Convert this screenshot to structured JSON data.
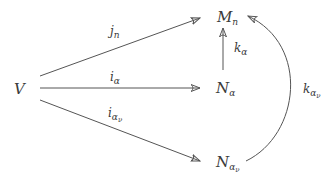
{
  "diagram": {
    "type": "commutative-diagram",
    "colors": {
      "stroke": "#555555",
      "text": "#3a3a3a",
      "background": "#ffffff"
    },
    "nodes": {
      "V": {
        "base": "V",
        "sub": "",
        "subsub": ""
      },
      "Mn": {
        "base": "M",
        "sub": "n",
        "subsub": ""
      },
      "Na": {
        "base": "N",
        "sub": "α",
        "subsub": ""
      },
      "Nav": {
        "base": "N",
        "sub": "α",
        "subsub": "ν"
      }
    },
    "edges": {
      "jn": {
        "from": "V",
        "to": "Mn",
        "base": "j",
        "sub": "n",
        "subsub": ""
      },
      "ia": {
        "from": "V",
        "to": "Na",
        "base": "i",
        "sub": "α",
        "subsub": ""
      },
      "iav": {
        "from": "V",
        "to": "Nav",
        "base": "i",
        "sub": "α",
        "subsub": "ν"
      },
      "ka": {
        "from": "Na",
        "to": "Mn",
        "base": "k",
        "sub": "α",
        "subsub": ""
      },
      "kav": {
        "from": "Nav",
        "to": "Mn",
        "base": "k",
        "sub": "α",
        "subsub": "ν",
        "curved": true
      }
    }
  }
}
